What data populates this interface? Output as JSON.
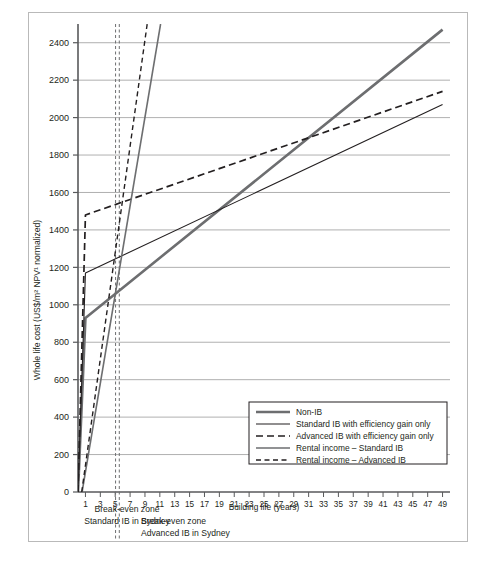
{
  "chart_data": {
    "type": "line",
    "title": "",
    "xlabel": "Building life (years)",
    "ylabel": "Whole life cost (US$/m² NPV¹ normalized)",
    "xlim": [
      0,
      50
    ],
    "ylim": [
      0,
      2500
    ],
    "xticks": [
      1,
      3,
      5,
      7,
      9,
      11,
      13,
      15,
      17,
      19,
      21,
      23,
      25,
      27,
      29,
      31,
      33,
      35,
      37,
      39,
      41,
      43,
      45,
      47,
      49
    ],
    "xtick_labels": [
      "1",
      "3",
      "5",
      "7",
      "9",
      "11",
      "13",
      "15",
      "17",
      "19",
      "21",
      "23",
      "25",
      "27",
      "29",
      "31",
      "33",
      "35",
      "37",
      "39",
      "41",
      "43",
      "45",
      "47",
      "49"
    ],
    "yticks": [
      0,
      200,
      400,
      600,
      800,
      1000,
      1200,
      1400,
      1600,
      1800,
      2000,
      2200,
      2400
    ],
    "ytick_labels": [
      "0",
      "200",
      "400",
      "600",
      "800",
      "1000",
      "1200",
      "1400",
      "1600",
      "1800",
      "2000",
      "2200",
      "2400"
    ],
    "grid": "horizontal",
    "legend_position": "bottom-right",
    "series": [
      {
        "name": "Non-IB",
        "color": "#6d6e70",
        "width": 2.6,
        "dash": "none",
        "points": [
          [
            0,
            0
          ],
          [
            1,
            930
          ],
          [
            49,
            2470
          ]
        ]
      },
      {
        "name": "Standard IB with efficiency gain only",
        "color": "#231f20",
        "width": 1.1,
        "dash": "none",
        "points": [
          [
            0,
            0
          ],
          [
            1,
            1170
          ],
          [
            49,
            2070
          ]
        ]
      },
      {
        "name": "Advanced IB with efficiency gain only",
        "color": "#231f20",
        "width": 1.7,
        "dash": "dashed",
        "points": [
          [
            0,
            0
          ],
          [
            1,
            1480
          ],
          [
            49,
            2140
          ]
        ]
      },
      {
        "name": "Rental income – Standard IB",
        "color": "#6d6e70",
        "width": 1.6,
        "dash": "none",
        "points": [
          [
            0.55,
            0
          ],
          [
            11.1,
            2500
          ]
        ]
      },
      {
        "name": "Rental income – Advanced IB",
        "color": "#231f20",
        "width": 1.4,
        "dash": "dashed",
        "points": [
          [
            0.5,
            0
          ],
          [
            9.3,
            2500
          ]
        ]
      }
    ],
    "markers": [
      {
        "name": "break-even-standard",
        "x": 5.05,
        "style": "vertical dashed",
        "color": "#6d6e70"
      },
      {
        "name": "break-even-advanced",
        "x": 5.55,
        "style": "vertical dashed",
        "color": "#6d6e70"
      }
    ],
    "annotations": [
      {
        "id": "standard",
        "line1": "Break-even zone",
        "line2": "Standard IB in Sydney"
      },
      {
        "id": "advanced",
        "line1": "Break-even zone",
        "line2": "Advanced IB in Sydney"
      }
    ]
  },
  "legend": {
    "items": [
      {
        "label": "Non-IB"
      },
      {
        "label": "Standard IB with efficiency gain only"
      },
      {
        "label": "Advanced IB with efficiency gain only"
      },
      {
        "label": "Rental income – Standard IB"
      },
      {
        "label": "Rental income – Advanced IB"
      }
    ]
  }
}
